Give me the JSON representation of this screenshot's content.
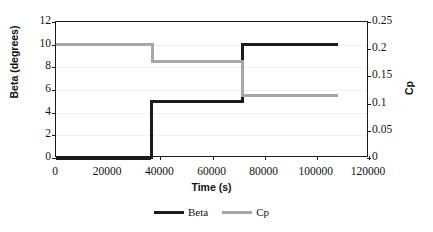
{
  "chart_data": {
    "type": "line",
    "title": "",
    "xlabel": "Time (s)",
    "ylabel": "Beta (degrees)",
    "y2label": "Cp",
    "xlim": [
      0,
      120000
    ],
    "ylim": [
      0,
      12
    ],
    "y2lim": [
      0,
      0.25
    ],
    "xticks": [
      "0",
      "20000",
      "40000",
      "60000",
      "80000",
      "100000",
      "120000"
    ],
    "xtick_values": [
      0,
      20000,
      40000,
      60000,
      80000,
      100000,
      120000
    ],
    "yticks": [
      "0",
      "2",
      "4",
      "6",
      "8",
      "10",
      "12"
    ],
    "ytick_values": [
      0,
      2,
      4,
      6,
      8,
      10,
      12
    ],
    "y2ticks": [
      "0",
      "0.05",
      "0.1",
      "0.15",
      "0.2",
      "0.25"
    ],
    "y2tick_values": [
      0,
      0.05,
      0.1,
      0.15,
      0.2,
      0.25
    ],
    "grid": true,
    "legend_position": "bottom",
    "interpolation": "step",
    "series": [
      {
        "name": "Beta",
        "axis": "left",
        "units": "degrees",
        "color": "#1b1b1b",
        "steps": [
          {
            "x_start": 0,
            "x_end": 36500,
            "value": 0
          },
          {
            "x_start": 36500,
            "x_end": 71500,
            "value": 5
          },
          {
            "x_start": 71500,
            "x_end": 108000,
            "value": 10
          }
        ]
      },
      {
        "name": "Cp",
        "axis": "right",
        "units": "",
        "color": "#a6a6a6",
        "steps": [
          {
            "x_start": 0,
            "x_end": 37000,
            "value": 0.209
          },
          {
            "x_start": 37000,
            "x_end": 71500,
            "value": 0.177
          },
          {
            "x_start": 71500,
            "x_end": 108000,
            "value": 0.115
          }
        ]
      }
    ],
    "legend": [
      {
        "label": "Beta",
        "color": "#1b1b1b"
      },
      {
        "label": "Cp",
        "color": "#a6a6a6"
      }
    ]
  }
}
